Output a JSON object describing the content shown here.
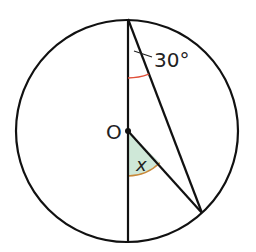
{
  "diagram": {
    "type": "circle-geometry",
    "labels": {
      "centre": "O",
      "given_angle": "30°",
      "unknown_angle": "x"
    },
    "colors": {
      "stroke": "#111111",
      "given_angle_arc": "#e0503a",
      "unknown_angle_fill": "#cfe8d8",
      "unknown_angle_arc": "#c8893a"
    },
    "angles": {
      "given_angle_deg": 30,
      "unknown_angle_label": "x"
    }
  }
}
